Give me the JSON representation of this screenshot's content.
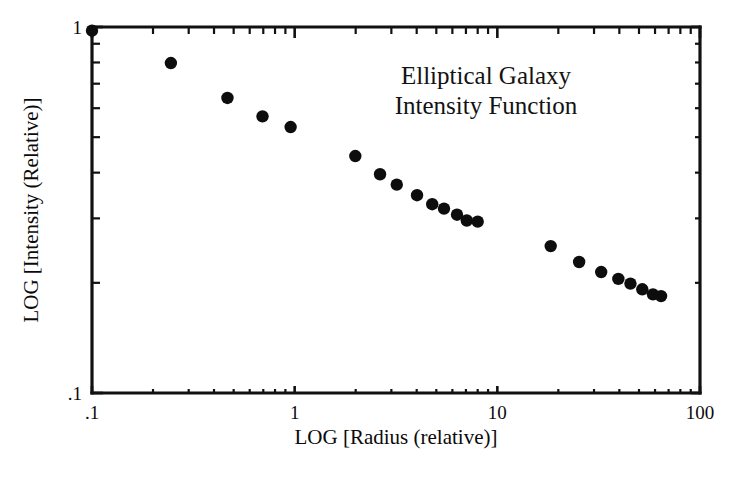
{
  "chart_data": {
    "type": "scatter",
    "title": "Elliptical Galaxy Intensity Function",
    "title_line1": "Elliptical Galaxy",
    "title_line2": "Intensity Function",
    "xlabel": "LOG [Radius (relative)]",
    "ylabel": "LOG [Intensity (Relative)]",
    "xscale": "log",
    "yscale": "log",
    "xlim": [
      0.1,
      100
    ],
    "ylim": [
      0.1,
      1.0
    ],
    "grid": false,
    "legend": null,
    "xticks": [
      {
        "value": 0.1,
        "label": ".1"
      },
      {
        "value": 1,
        "label": "1"
      },
      {
        "value": 10,
        "label": "10"
      },
      {
        "value": 100,
        "label": "100"
      }
    ],
    "yticks": [
      {
        "value": 1,
        "label": "1"
      },
      {
        "value": 0.1,
        "label": ".1"
      }
    ],
    "marker": "filled-circle",
    "marker_color": "#0d0d0d",
    "series": [
      {
        "name": "Elliptical galaxy surface brightness",
        "points": [
          {
            "x": 0.1,
            "y": 0.977
          },
          {
            "x": 0.245,
            "y": 0.797
          },
          {
            "x": 0.466,
            "y": 0.64
          },
          {
            "x": 0.694,
            "y": 0.57
          },
          {
            "x": 0.955,
            "y": 0.533
          },
          {
            "x": 1.992,
            "y": 0.444
          },
          {
            "x": 2.638,
            "y": 0.396
          },
          {
            "x": 3.19,
            "y": 0.371
          },
          {
            "x": 4.016,
            "y": 0.347
          },
          {
            "x": 4.772,
            "y": 0.328
          },
          {
            "x": 5.455,
            "y": 0.319
          },
          {
            "x": 6.324,
            "y": 0.307
          },
          {
            "x": 7.066,
            "y": 0.296
          },
          {
            "x": 8.0,
            "y": 0.294
          },
          {
            "x": 18.34,
            "y": 0.252
          },
          {
            "x": 25.33,
            "y": 0.228
          },
          {
            "x": 32.55,
            "y": 0.214
          },
          {
            "x": 39.55,
            "y": 0.205
          },
          {
            "x": 45.38,
            "y": 0.199
          },
          {
            "x": 51.91,
            "y": 0.192
          },
          {
            "x": 58.61,
            "y": 0.186
          },
          {
            "x": 64.27,
            "y": 0.184
          }
        ]
      }
    ]
  }
}
